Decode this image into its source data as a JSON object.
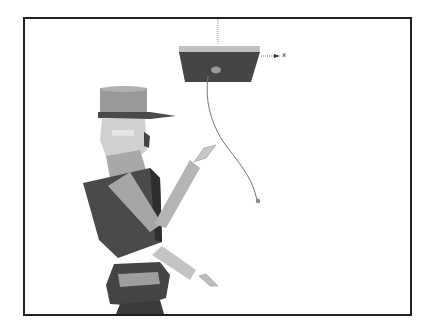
{
  "figure": {
    "axis_label": "x",
    "colors": {
      "frame": "#222222",
      "dark": "#3a3a3a",
      "mid": "#6e6e6e",
      "light": "#b4b4b4",
      "lighter": "#d2d2d2",
      "string": "#777777"
    }
  }
}
